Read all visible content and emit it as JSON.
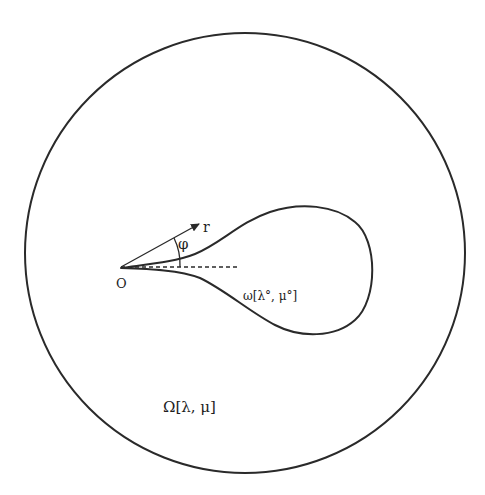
{
  "diagram": {
    "domain_label": "Ω[λ, μ]",
    "region_label": "ω[λ°, μ°]",
    "origin_label": "O",
    "radius_label": "r",
    "angle_label": "φ",
    "colors": {
      "ink": "#2a2a2a",
      "background": "#ffffff"
    }
  }
}
